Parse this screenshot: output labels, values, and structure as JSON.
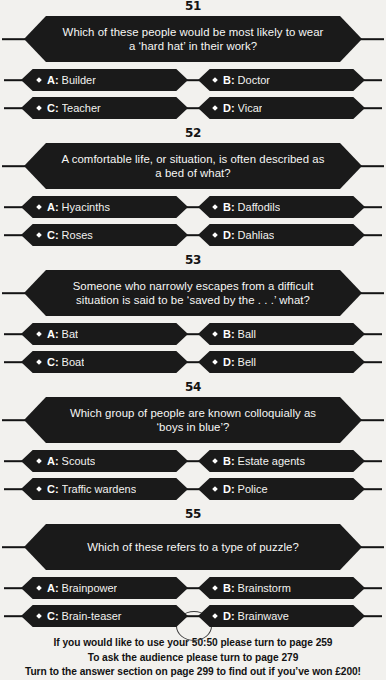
{
  "questions": [
    {
      "number": "51",
      "prompt": "Which of these people would be most likely to wear a ‘hard hat’ in their work?",
      "answers": [
        {
          "letter": "A:",
          "text": "Builder"
        },
        {
          "letter": "B:",
          "text": "Doctor"
        },
        {
          "letter": "C:",
          "text": "Teacher"
        },
        {
          "letter": "D:",
          "text": "Vicar"
        }
      ]
    },
    {
      "number": "52",
      "prompt": "A comfortable life, or situation, is often described as a bed of what?",
      "answers": [
        {
          "letter": "A:",
          "text": "Hyacinths"
        },
        {
          "letter": "B:",
          "text": "Daffodils"
        },
        {
          "letter": "C:",
          "text": "Roses"
        },
        {
          "letter": "D:",
          "text": "Dahlias"
        }
      ]
    },
    {
      "number": "53",
      "prompt": "Someone who narrowly escapes from a difficult situation is said to be ‘saved by the . . .’ what?",
      "answers": [
        {
          "letter": "A:",
          "text": "Bat"
        },
        {
          "letter": "B:",
          "text": "Ball"
        },
        {
          "letter": "C:",
          "text": "Boat"
        },
        {
          "letter": "D:",
          "text": "Bell"
        }
      ]
    },
    {
      "number": "54",
      "prompt": "Which group of people are known colloquially as ‘boys in blue’?",
      "answers": [
        {
          "letter": "A:",
          "text": "Scouts"
        },
        {
          "letter": "B:",
          "text": "Estate agents"
        },
        {
          "letter": "C:",
          "text": "Traffic wardens"
        },
        {
          "letter": "D:",
          "text": "Police"
        }
      ]
    },
    {
      "number": "55",
      "prompt": "Which of these refers to a type of puzzle?",
      "answers": [
        {
          "letter": "A:",
          "text": "Brainpower"
        },
        {
          "letter": "B:",
          "text": "Brainstorm"
        },
        {
          "letter": "C:",
          "text": "Brain-teaser"
        },
        {
          "letter": "D:",
          "text": "Brainwave"
        }
      ]
    }
  ],
  "footer": {
    "line1": "If you would like to use your 50:50 please turn to page 259",
    "line2": "To ask the audience please turn to page 279",
    "line3": "Turn to the answer section on page 299 to find out if you’ve won £200!"
  },
  "colors": {
    "banner": "#1a1a1a",
    "background": "#f2f1ee",
    "text_on_banner": "#f7f7f5",
    "ink": "#131313"
  }
}
